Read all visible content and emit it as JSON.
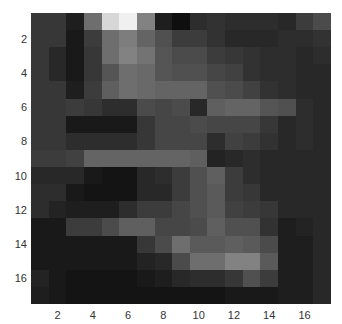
{
  "chart_data": {
    "type": "heatmap",
    "title": "",
    "xlabel": "",
    "ylabel": "",
    "colormap": "gray",
    "rows": 17,
    "cols": 17,
    "xlim": [
      0.5,
      17.5
    ],
    "ylim": [
      17.5,
      0.5
    ],
    "x_ticks": [
      "2",
      "4",
      "6",
      "8",
      "10",
      "12",
      "14",
      "16"
    ],
    "y_ticks": [
      "2",
      "4",
      "6",
      "8",
      "10",
      "12",
      "14",
      "16"
    ],
    "grid": false,
    "legend": "none",
    "value_scale": "grayscale 0-255 (estimated)",
    "values": [
      [
        55,
        55,
        30,
        110,
        215,
        240,
        130,
        30,
        15,
        45,
        50,
        45,
        45,
        45,
        40,
        60,
        75
      ],
      [
        55,
        55,
        25,
        60,
        110,
        125,
        100,
        80,
        60,
        60,
        50,
        40,
        40,
        40,
        45,
        45,
        50
      ],
      [
        55,
        40,
        25,
        55,
        110,
        130,
        115,
        85,
        75,
        75,
        60,
        55,
        50,
        45,
        45,
        40,
        45
      ],
      [
        55,
        40,
        25,
        55,
        85,
        110,
        105,
        85,
        80,
        80,
        70,
        65,
        50,
        45,
        45,
        40,
        40
      ],
      [
        55,
        55,
        30,
        60,
        95,
        110,
        105,
        100,
        100,
        100,
        80,
        75,
        65,
        50,
        45,
        40,
        40
      ],
      [
        55,
        55,
        60,
        55,
        45,
        45,
        75,
        70,
        75,
        40,
        95,
        100,
        100,
        85,
        80,
        45,
        40
      ],
      [
        55,
        55,
        25,
        25,
        25,
        25,
        55,
        70,
        70,
        75,
        70,
        70,
        70,
        55,
        40,
        45,
        40
      ],
      [
        55,
        55,
        45,
        45,
        45,
        45,
        55,
        70,
        70,
        70,
        45,
        65,
        60,
        50,
        40,
        45,
        40
      ],
      [
        60,
        60,
        65,
        100,
        100,
        100,
        100,
        100,
        100,
        95,
        35,
        40,
        45,
        40,
        40,
        40,
        40
      ],
      [
        40,
        40,
        40,
        25,
        20,
        20,
        40,
        45,
        60,
        80,
        95,
        60,
        45,
        40,
        40,
        40,
        40
      ],
      [
        45,
        45,
        25,
        20,
        20,
        20,
        40,
        40,
        60,
        80,
        90,
        60,
        55,
        40,
        40,
        40,
        40
      ],
      [
        45,
        35,
        30,
        30,
        30,
        45,
        60,
        60,
        70,
        80,
        90,
        65,
        60,
        55,
        40,
        40,
        40
      ],
      [
        25,
        25,
        60,
        60,
        75,
        95,
        95,
        70,
        70,
        75,
        95,
        80,
        80,
        50,
        30,
        35,
        40
      ],
      [
        25,
        25,
        25,
        25,
        25,
        25,
        55,
        75,
        110,
        90,
        90,
        95,
        90,
        75,
        30,
        30,
        40
      ],
      [
        25,
        25,
        25,
        25,
        25,
        25,
        35,
        40,
        75,
        110,
        110,
        130,
        130,
        90,
        30,
        30,
        40
      ],
      [
        35,
        25,
        20,
        20,
        20,
        20,
        25,
        30,
        40,
        45,
        45,
        55,
        80,
        60,
        30,
        30,
        40
      ],
      [
        30,
        25,
        20,
        20,
        20,
        20,
        20,
        20,
        20,
        20,
        20,
        25,
        25,
        25,
        30,
        30,
        40
      ]
    ]
  }
}
